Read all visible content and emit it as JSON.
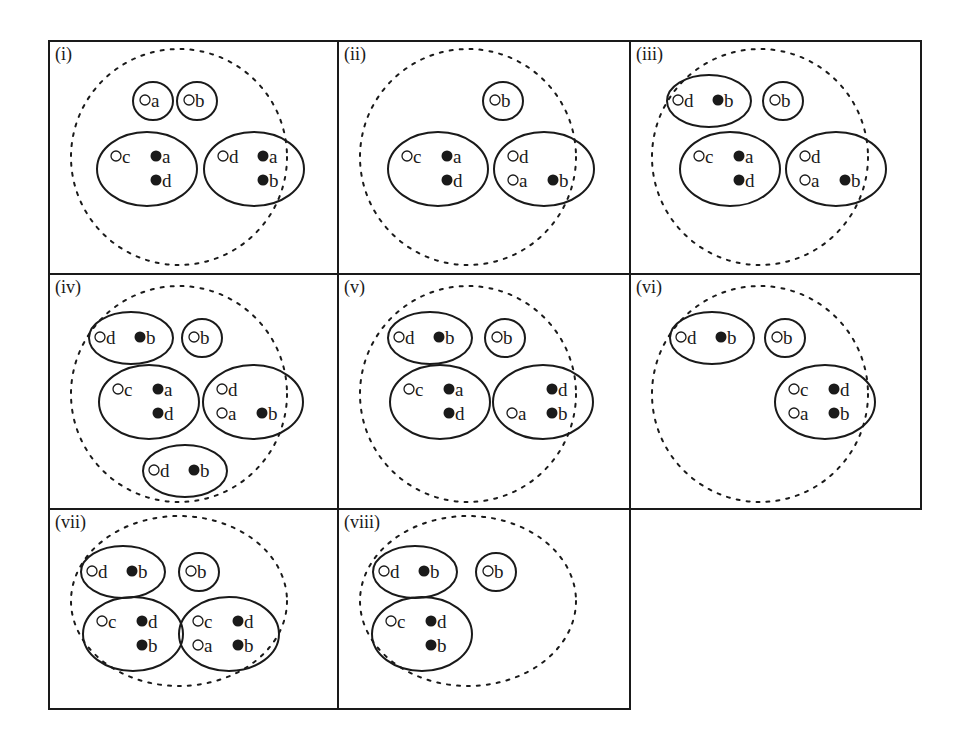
{
  "figure": {
    "legend_symbols": {
      "open": "o",
      "filled": "•"
    },
    "colors": {
      "stroke": "#1a1a1a",
      "background": "#ffffff"
    },
    "panels": [
      {
        "label": "(i)",
        "groups": [
          {
            "id": "g1",
            "rows": [
              [
                {
                  "t": "open",
                  "c": "a"
                }
              ]
            ]
          },
          {
            "id": "g2",
            "rows": [
              [
                {
                  "t": "open",
                  "c": "b"
                }
              ]
            ]
          },
          {
            "id": "g3",
            "rows": [
              [
                {
                  "t": "open",
                  "c": "c"
                },
                {
                  "t": "filled",
                  "c": "a"
                }
              ],
              [
                {
                  "t": "empty"
                },
                {
                  "t": "filled",
                  "c": "d"
                }
              ]
            ]
          },
          {
            "id": "g4",
            "rows": [
              [
                {
                  "t": "open",
                  "c": "d"
                },
                {
                  "t": "filled",
                  "c": "a"
                }
              ],
              [
                {
                  "t": "empty"
                },
                {
                  "t": "filled",
                  "c": "b"
                }
              ]
            ]
          }
        ]
      },
      {
        "label": "(ii)",
        "groups": [
          {
            "id": "g1",
            "rows": [
              [
                {
                  "t": "open",
                  "c": "b"
                }
              ]
            ]
          },
          {
            "id": "g2",
            "rows": [
              [
                {
                  "t": "open",
                  "c": "c"
                },
                {
                  "t": "filled",
                  "c": "a"
                }
              ],
              [
                {
                  "t": "empty"
                },
                {
                  "t": "filled",
                  "c": "d"
                }
              ]
            ]
          },
          {
            "id": "g3",
            "rows": [
              [
                {
                  "t": "open",
                  "c": "d"
                },
                {
                  "t": "empty"
                }
              ],
              [
                {
                  "t": "open",
                  "c": "a"
                },
                {
                  "t": "filled",
                  "c": "b"
                }
              ]
            ]
          }
        ]
      },
      {
        "label": "(iii)",
        "groups": [
          {
            "id": "g1",
            "rows": [
              [
                {
                  "t": "open",
                  "c": "d"
                },
                {
                  "t": "filled",
                  "c": "b"
                }
              ]
            ]
          },
          {
            "id": "g2",
            "rows": [
              [
                {
                  "t": "open",
                  "c": "b"
                }
              ]
            ]
          },
          {
            "id": "g3",
            "rows": [
              [
                {
                  "t": "open",
                  "c": "c"
                },
                {
                  "t": "filled",
                  "c": "a"
                }
              ],
              [
                {
                  "t": "empty"
                },
                {
                  "t": "filled",
                  "c": "d"
                }
              ]
            ]
          },
          {
            "id": "g4",
            "rows": [
              [
                {
                  "t": "open",
                  "c": "d"
                },
                {
                  "t": "empty"
                }
              ],
              [
                {
                  "t": "open",
                  "c": "a"
                },
                {
                  "t": "filled",
                  "c": "b"
                }
              ]
            ]
          }
        ]
      },
      {
        "label": "(iv)",
        "groups": [
          {
            "id": "g1",
            "rows": [
              [
                {
                  "t": "open",
                  "c": "d"
                },
                {
                  "t": "filled",
                  "c": "b"
                }
              ]
            ]
          },
          {
            "id": "g2",
            "rows": [
              [
                {
                  "t": "open",
                  "c": "b"
                }
              ]
            ]
          },
          {
            "id": "g3",
            "rows": [
              [
                {
                  "t": "open",
                  "c": "c"
                },
                {
                  "t": "filled",
                  "c": "a"
                }
              ],
              [
                {
                  "t": "empty"
                },
                {
                  "t": "filled",
                  "c": "d"
                }
              ]
            ]
          },
          {
            "id": "g4",
            "rows": [
              [
                {
                  "t": "open",
                  "c": "d"
                },
                {
                  "t": "empty"
                }
              ],
              [
                {
                  "t": "open",
                  "c": "a"
                },
                {
                  "t": "filled",
                  "c": "b"
                }
              ]
            ]
          },
          {
            "id": "g5",
            "rows": [
              [
                {
                  "t": "open",
                  "c": "d"
                },
                {
                  "t": "filled",
                  "c": "b"
                }
              ]
            ]
          }
        ]
      },
      {
        "label": "(v)",
        "groups": [
          {
            "id": "g1",
            "rows": [
              [
                {
                  "t": "open",
                  "c": "d"
                },
                {
                  "t": "filled",
                  "c": "b"
                }
              ]
            ]
          },
          {
            "id": "g2",
            "rows": [
              [
                {
                  "t": "open",
                  "c": "b"
                }
              ]
            ]
          },
          {
            "id": "g3",
            "rows": [
              [
                {
                  "t": "open",
                  "c": "c"
                },
                {
                  "t": "filled",
                  "c": "a"
                }
              ],
              [
                {
                  "t": "empty"
                },
                {
                  "t": "filled",
                  "c": "d"
                }
              ]
            ]
          },
          {
            "id": "g4",
            "rows": [
              [
                {
                  "t": "empty"
                },
                {
                  "t": "filled",
                  "c": "d"
                }
              ],
              [
                {
                  "t": "open",
                  "c": "a"
                },
                {
                  "t": "filled",
                  "c": "b"
                }
              ]
            ]
          }
        ]
      },
      {
        "label": "(vi)",
        "groups": [
          {
            "id": "g1",
            "rows": [
              [
                {
                  "t": "open",
                  "c": "d"
                },
                {
                  "t": "filled",
                  "c": "b"
                }
              ]
            ]
          },
          {
            "id": "g2",
            "rows": [
              [
                {
                  "t": "open",
                  "c": "b"
                }
              ]
            ]
          },
          {
            "id": "g3",
            "rows": [
              [
                {
                  "t": "open",
                  "c": "c"
                },
                {
                  "t": "filled",
                  "c": "d"
                }
              ],
              [
                {
                  "t": "open",
                  "c": "a"
                },
                {
                  "t": "filled",
                  "c": "b"
                }
              ]
            ]
          }
        ]
      },
      {
        "label": "(vii)",
        "groups": [
          {
            "id": "g1",
            "rows": [
              [
                {
                  "t": "open",
                  "c": "d"
                },
                {
                  "t": "filled",
                  "c": "b"
                }
              ]
            ]
          },
          {
            "id": "g2",
            "rows": [
              [
                {
                  "t": "open",
                  "c": "b"
                }
              ]
            ]
          },
          {
            "id": "g3",
            "rows": [
              [
                {
                  "t": "open",
                  "c": "c"
                },
                {
                  "t": "filled",
                  "c": "d"
                }
              ],
              [
                {
                  "t": "empty"
                },
                {
                  "t": "filled",
                  "c": "b"
                }
              ]
            ]
          },
          {
            "id": "g4",
            "rows": [
              [
                {
                  "t": "open",
                  "c": "c"
                },
                {
                  "t": "filled",
                  "c": "d"
                }
              ],
              [
                {
                  "t": "open",
                  "c": "a"
                },
                {
                  "t": "filled",
                  "c": "b"
                }
              ]
            ]
          }
        ]
      },
      {
        "label": "(viii)",
        "groups": [
          {
            "id": "g1",
            "rows": [
              [
                {
                  "t": "open",
                  "c": "d"
                },
                {
                  "t": "filled",
                  "c": "b"
                }
              ]
            ]
          },
          {
            "id": "g2",
            "rows": [
              [
                {
                  "t": "open",
                  "c": "b"
                }
              ]
            ]
          },
          {
            "id": "g3",
            "rows": [
              [
                {
                  "t": "open",
                  "c": "c"
                },
                {
                  "t": "filled",
                  "c": "d"
                }
              ],
              [
                {
                  "t": "empty"
                },
                {
                  "t": "filled",
                  "c": "b"
                }
              ]
            ]
          }
        ]
      }
    ]
  }
}
